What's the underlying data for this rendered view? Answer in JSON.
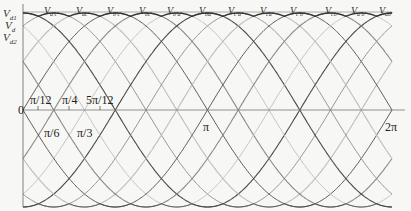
{
  "diagram": {
    "y_axis_labels": [
      {
        "main": "V",
        "sub": "d1"
      },
      {
        "main": "V",
        "sub": "d"
      },
      {
        "main": "V",
        "sub": "d2"
      }
    ],
    "waveform_labels": [
      {
        "main": "V",
        "sub": "a'c'"
      },
      {
        "main": "V",
        "sub": "ac'"
      },
      {
        "main": "V",
        "sub": "b'c'"
      },
      {
        "main": "V",
        "sub": "bc'"
      },
      {
        "main": "V",
        "sub": "b'a'"
      },
      {
        "main": "V",
        "sub": "ba'"
      },
      {
        "main": "V",
        "sub": "c'a'"
      },
      {
        "main": "V",
        "sub": "ca'"
      },
      {
        "main": "V",
        "sub": "c'b'"
      },
      {
        "main": "V",
        "sub": "cb'"
      },
      {
        "main": "V",
        "sub": "a'b'"
      },
      {
        "main": "V",
        "sub": "ab'"
      }
    ],
    "x_ticks_above": [
      "π/12",
      "π/4",
      "5π/12"
    ],
    "x_ticks_below": [
      "π/6",
      "π/3"
    ],
    "origin_label": "0",
    "pi_label": "π",
    "two_pi_label": "2π",
    "colors": {
      "dark": "#4a4a4a",
      "mid": "#8a8a8a",
      "light": "#bdbdbd",
      "envelope": "#333333",
      "axis": "#666666"
    }
  }
}
